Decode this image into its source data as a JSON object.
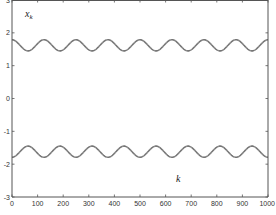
{
  "chart_data": {
    "type": "line",
    "title": "",
    "xlabel": "k",
    "ylabel": "x_k",
    "ylabel_main": "x",
    "ylabel_sub": "k",
    "xlim": [
      0,
      1000
    ],
    "ylim": [
      -3,
      3
    ],
    "grid": false,
    "legend": null,
    "x_ticks": [
      0,
      100,
      200,
      300,
      400,
      500,
      600,
      700,
      800,
      900,
      1000
    ],
    "y_ticks": [
      -3,
      -2,
      -1,
      0,
      1,
      2,
      3
    ],
    "x_tick_labels": [
      "0",
      "100",
      "200",
      "300",
      "400",
      "500",
      "600",
      "700",
      "800",
      "900",
      "1000"
    ],
    "y_tick_labels": [
      "-3",
      "-2",
      "-1",
      "0",
      "1",
      "2",
      "3"
    ],
    "series": [
      {
        "name": "upper branch",
        "description": "oscillation around ~1.62, amplitude ~0.17, period ~125 samples (8 periods over k=0..1000), starts at maximum",
        "center": 1.62,
        "amplitude": 0.17,
        "period": 125,
        "phase": "cos",
        "x": [
          0,
          31,
          62,
          94,
          125,
          156,
          188,
          219,
          250,
          281,
          312,
          344,
          375,
          406,
          438,
          469,
          500,
          531,
          562,
          594,
          625,
          656,
          688,
          719,
          750,
          781,
          812,
          844,
          875,
          906,
          938,
          969,
          1000
        ],
        "values": [
          1.79,
          1.62,
          1.45,
          1.62,
          1.79,
          1.62,
          1.45,
          1.62,
          1.79,
          1.62,
          1.45,
          1.62,
          1.79,
          1.62,
          1.45,
          1.62,
          1.79,
          1.62,
          1.45,
          1.62,
          1.79,
          1.62,
          1.45,
          1.62,
          1.79,
          1.62,
          1.45,
          1.62,
          1.79,
          1.62,
          1.45,
          1.62,
          1.79
        ],
        "color": "#8a8a8a",
        "style": "dashed-over-solid"
      },
      {
        "name": "lower branch",
        "description": "mirror of upper branch: oscillation around ~-1.62, amplitude ~0.17, period ~125 samples, starts at minimum",
        "center": -1.62,
        "amplitude": 0.17,
        "period": 125,
        "phase": "-cos",
        "x": [
          0,
          31,
          62,
          94,
          125,
          156,
          188,
          219,
          250,
          281,
          312,
          344,
          375,
          406,
          438,
          469,
          500,
          531,
          562,
          594,
          625,
          656,
          688,
          719,
          750,
          781,
          812,
          844,
          875,
          906,
          938,
          969,
          1000
        ],
        "values": [
          -1.79,
          -1.62,
          -1.45,
          -1.62,
          -1.79,
          -1.62,
          -1.45,
          -1.62,
          -1.79,
          -1.62,
          -1.45,
          -1.62,
          -1.79,
          -1.62,
          -1.45,
          -1.62,
          -1.79,
          -1.62,
          -1.45,
          -1.62,
          -1.79,
          -1.62,
          -1.45,
          -1.62,
          -1.79,
          -1.62,
          -1.45,
          -1.62,
          -1.79,
          -1.62,
          -1.45,
          -1.62,
          -1.79
        ],
        "color": "#8a8a8a",
        "style": "dashed-over-solid"
      }
    ],
    "colors": {
      "axis": "#555555",
      "curve": "#8a8a8a",
      "curve_dash": "#555555",
      "background": "#ffffff"
    }
  }
}
